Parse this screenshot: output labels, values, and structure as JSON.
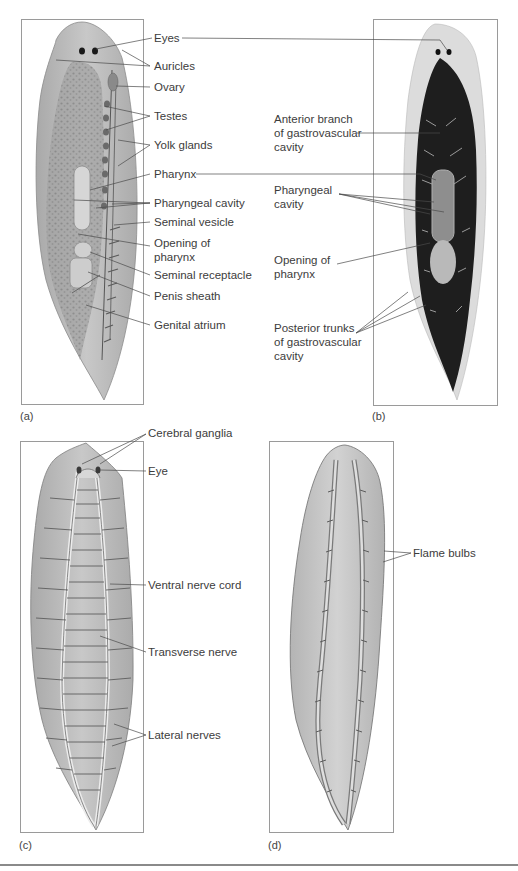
{
  "figure": {
    "panels": [
      {
        "id": "a",
        "letter": "(a)",
        "kind": "illustration",
        "labels": [
          {
            "key": "eyes",
            "text": "Eyes"
          },
          {
            "key": "auricles",
            "text": "Auricles"
          },
          {
            "key": "ovary",
            "text": "Ovary"
          },
          {
            "key": "testes",
            "text": "Testes"
          },
          {
            "key": "yolk_glands",
            "text": "Yolk glands"
          },
          {
            "key": "pharynx",
            "text": "Pharynx"
          },
          {
            "key": "pharyngeal_cavity",
            "text": "Pharyngeal cavity"
          },
          {
            "key": "seminal_vesicle",
            "text": "Seminal vesicle"
          },
          {
            "key": "opening_of_pharynx",
            "text": "Opening of\npharynx"
          },
          {
            "key": "seminal_receptacle",
            "text": "Seminal receptacle"
          },
          {
            "key": "penis_sheath",
            "text": "Penis sheath"
          },
          {
            "key": "genital_atrium",
            "text": "Genital atrium"
          }
        ]
      },
      {
        "id": "b",
        "letter": "(b)",
        "kind": "photograph",
        "labels": [
          {
            "key": "anterior_branch",
            "text": "Anterior branch\nof gastrovascular\ncavity"
          },
          {
            "key": "pharyngeal_cavity",
            "text": "Pharyngeal\ncavity"
          },
          {
            "key": "opening_of_pharynx",
            "text": "Opening of\npharynx"
          },
          {
            "key": "posterior_trunks",
            "text": "Posterior trunks\nof gastrovascular\ncavity"
          }
        ]
      },
      {
        "id": "c",
        "letter": "(c)",
        "kind": "illustration",
        "labels": [
          {
            "key": "cerebral_ganglia",
            "text": "Cerebral ganglia"
          },
          {
            "key": "eye",
            "text": "Eye"
          },
          {
            "key": "ventral_nerve_cord",
            "text": "Ventral nerve cord"
          },
          {
            "key": "transverse_nerve",
            "text": "Transverse nerve"
          },
          {
            "key": "lateral_nerves",
            "text": "Lateral nerves"
          }
        ]
      },
      {
        "id": "d",
        "letter": "(d)",
        "kind": "illustration",
        "labels": [
          {
            "key": "flame_bulbs",
            "text": "Flame bulbs"
          }
        ]
      }
    ],
    "colors": {
      "body_fill": "#b9b9b9",
      "body_edge": "#8c8c8c",
      "gut_dark": "#1c1c1c",
      "leader_line": "#4a4a4a",
      "box_border": "#9a9a9a"
    }
  }
}
